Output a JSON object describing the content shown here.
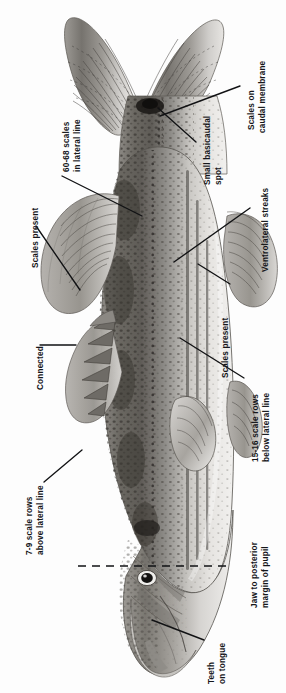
{
  "figure": {
    "kind": "scientific-illustration",
    "orientation": "vertical",
    "background_color": "#fdfdfd",
    "ink_color": "#15161a",
    "description_visible_text": false
  },
  "annotations": [
    {
      "id": "scales-on-caudal-membrane",
      "lines": [
        "Scales on",
        "caudal membrane"
      ],
      "side": "right",
      "leader": "diagonal"
    },
    {
      "id": "small-basicaudal-spot",
      "lines": [
        "Small basicaudal",
        "spot"
      ],
      "side": "right",
      "leader": "diagonal"
    },
    {
      "id": "ventrolateral-streaks",
      "lines": [
        "Ventrolateral streaks"
      ],
      "side": "right",
      "leader": "diagonal"
    },
    {
      "id": "scales-present-right",
      "lines": [
        "Scales present"
      ],
      "side": "right",
      "leader": "diagonal"
    },
    {
      "id": "scale-rows-below-lateral-line",
      "lines": [
        "15-16 scale rows",
        "below lateral line"
      ],
      "side": "right",
      "leader": "diagonal"
    },
    {
      "id": "jaw-to-posterior-margin-of-pupil",
      "lines": [
        "Jaw to posterior",
        "margin of pupil"
      ],
      "side": "right",
      "leader": "dashed-horizontal"
    },
    {
      "id": "teeth-on-tongue",
      "lines": [
        "Teeth",
        "on tongue"
      ],
      "side": "right",
      "leader": "diagonal"
    },
    {
      "id": "scales-in-lateral-line",
      "lines": [
        "60-68 scales",
        "in lateral line"
      ],
      "side": "left",
      "leader": "diagonal"
    },
    {
      "id": "scales-present-left",
      "lines": [
        "Scales present"
      ],
      "side": "left",
      "leader": "diagonal"
    },
    {
      "id": "connected",
      "lines": [
        "Connected"
      ],
      "side": "left",
      "leader": "horizontal"
    },
    {
      "id": "scale-rows-above-lateral-line",
      "lines": [
        "7-9 scale rows",
        "above lateral line"
      ],
      "side": "left",
      "leader": "diagonal"
    }
  ]
}
